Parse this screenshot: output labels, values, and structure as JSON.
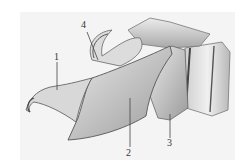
{
  "figure": {
    "labels": [
      {
        "id": "1",
        "text": "1"
      },
      {
        "id": "2",
        "text": "2"
      },
      {
        "id": "3",
        "text": "3"
      },
      {
        "id": "4",
        "text": "4"
      }
    ],
    "colors": {
      "background": "#f4f4f4",
      "shade_light": "#e2e2e2",
      "shade_mid": "#bdbdbd",
      "shade_dark": "#6e6e6e",
      "line": "#444444"
    }
  }
}
